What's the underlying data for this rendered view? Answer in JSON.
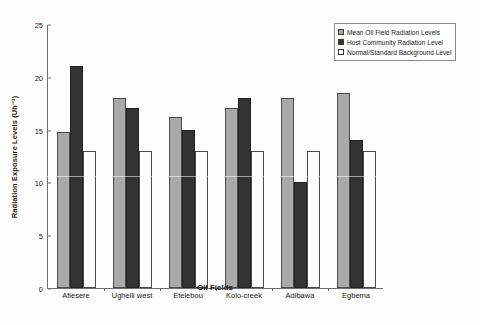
{
  "chart_data": {
    "type": "bar",
    "title": "",
    "xlabel": "Oil Fields",
    "ylabel": "Radiation Exposure Levels (Uh⁻¹)",
    "categories": [
      "Afiesere",
      "Ughelli west",
      "Etelebou",
      "Kolo-creek",
      "Adibawa",
      "Egbema"
    ],
    "series": [
      {
        "name": "Mean Oil Field Radiation Levels",
        "color": "#a9a9a9",
        "values": [
          14.8,
          18.0,
          16.2,
          17.0,
          18.0,
          18.5
        ]
      },
      {
        "name": "Host Community Radiation Level",
        "color": "#333333",
        "values": [
          21.0,
          17.0,
          15.0,
          18.0,
          10.0,
          14.0
        ]
      },
      {
        "name": "Normal/Standard Background Level",
        "color": "#ffffff",
        "values": [
          13.0,
          13.0,
          13.0,
          13.0,
          13.0,
          13.0
        ]
      }
    ],
    "ylim": [
      0,
      25
    ],
    "yticks": [
      0,
      5,
      10,
      15,
      20,
      25
    ],
    "grid": false,
    "legend_position": "top-right"
  },
  "legend": {
    "items": [
      "Mean Oil Field Radiation Levels",
      "Host Community Radiation Level",
      "Normal/Standard Background Level"
    ]
  }
}
